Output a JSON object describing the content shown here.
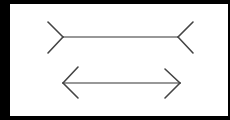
{
  "figure": {
    "background_color": "#000000",
    "panel_color": "#ffffff",
    "stroke_color": "#555555",
    "figures": [
      {
        "name": "fins-out-line",
        "shaft": [
          63,
          37,
          178,
          37
        ],
        "fins": [
          [
            48,
            22,
            63,
            37
          ],
          [
            48,
            53,
            63,
            37
          ],
          [
            193,
            22,
            178,
            37
          ],
          [
            193,
            53,
            178,
            37
          ]
        ]
      },
      {
        "name": "arrowheads-line",
        "shaft": [
          63,
          83,
          180,
          83
        ],
        "fins": [
          [
            78,
            67,
            63,
            83
          ],
          [
            78,
            98,
            63,
            83
          ],
          [
            165,
            69,
            180,
            83
          ],
          [
            165,
            98,
            180,
            83
          ]
        ]
      }
    ]
  }
}
